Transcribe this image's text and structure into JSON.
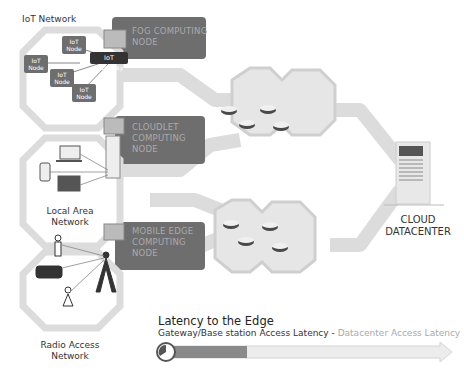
{
  "networks": {
    "iot": {
      "label": "IoT Network",
      "nodes": [
        "IoT Node",
        "IoT Node",
        "IoT Node",
        "IoT Node"
      ],
      "gateway": "IoT Gateway"
    },
    "lan": {
      "label_line1": "Local Area",
      "label_line2": "Network"
    },
    "ran": {
      "label_line1": "Radio Access",
      "label_line2": "Network"
    }
  },
  "edge_nodes": {
    "fog": {
      "line1": "FOG COMPUTING",
      "line2": "NODE"
    },
    "cloudlet": {
      "line1": "CLOUDLET",
      "line2": "COMPUTING",
      "line3": "NODE"
    },
    "mec": {
      "line1": "MOBILE EDGE",
      "line2": "COMPUTING",
      "line3": "NODE"
    }
  },
  "cloud": {
    "line1": "CLOUD",
    "line2": "DATACENTER"
  },
  "latency": {
    "title": "Latency to the Edge",
    "gateway_label": "Gateway/Base station Access Latency",
    "separator": " - ",
    "datacenter_label": "Datacenter Access Latency"
  },
  "colors": {
    "dark": "#555555",
    "mid": "#8a8a8a",
    "light": "#d9d9d9",
    "node_box": "#6e6e6e"
  }
}
